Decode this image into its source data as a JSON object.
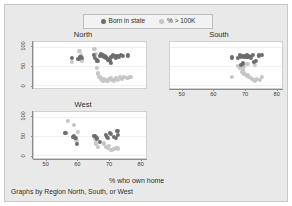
{
  "chart_data": {
    "type": "scatter",
    "title": "",
    "xlabel": "% who own home",
    "ylabel": "",
    "caption": "Graphs by Region North, South, or West",
    "xlim": [
      46,
      82
    ],
    "ylim": [
      -8,
      112
    ],
    "xticks": [
      50,
      60,
      70,
      80
    ],
    "yticks": [
      0,
      50,
      100
    ],
    "grid": true,
    "legend_position": "top-center",
    "colors": {
      "born_in_state": "#6d6d6d",
      "pct_over_100k": "#c6c6c6",
      "figure_background": "#e9e9e9",
      "plot_background": "#ffffff",
      "axis": "#8d8d8d",
      "text": "#2e2e2e"
    },
    "legend": [
      {
        "label": "Born in state",
        "color": "#6d6d6d"
      },
      {
        "label": "% > 100K",
        "color": "#c6c6c6"
      }
    ],
    "panels": [
      {
        "name": "North",
        "title": "North",
        "series": [
          {
            "name": "Born in state",
            "color": "#6d6d6d",
            "points": [
              [
                58.2,
                71
              ],
              [
                60.3,
                68
              ],
              [
                60.9,
                73
              ],
              [
                61.4,
                70
              ],
              [
                65.3,
                78
              ],
              [
                65.6,
                71
              ],
              [
                66.2,
                64
              ],
              [
                66.5,
                62
              ],
              [
                67.1,
                75
              ],
              [
                67.6,
                80
              ],
              [
                68.0,
                77
              ],
              [
                68.4,
                74
              ],
              [
                68.8,
                76
              ],
              [
                69.1,
                72
              ],
              [
                69.5,
                70
              ],
              [
                69.9,
                66
              ],
              [
                70.3,
                64
              ],
              [
                70.6,
                58
              ],
              [
                70.9,
                73
              ],
              [
                71.4,
                78
              ],
              [
                71.9,
                75
              ],
              [
                72.3,
                72
              ],
              [
                72.8,
                76
              ],
              [
                73.2,
                74
              ],
              [
                73.9,
                78
              ],
              [
                74.6,
                75
              ],
              [
                76.1,
                77
              ]
            ]
          },
          {
            "name": "% > 100K",
            "color": "#c6c6c6",
            "points": [
              [
                58.2,
                60
              ],
              [
                60.6,
                88
              ],
              [
                61.0,
                78
              ],
              [
                61.3,
                64
              ],
              [
                65.4,
                95
              ],
              [
                65.8,
                82
              ],
              [
                66.1,
                45
              ],
              [
                66.6,
                30
              ],
              [
                67.0,
                22
              ],
              [
                67.4,
                17
              ],
              [
                67.8,
                14
              ],
              [
                68.2,
                12
              ],
              [
                68.6,
                15
              ],
              [
                69.0,
                11
              ],
              [
                69.4,
                13
              ],
              [
                69.8,
                10
              ],
              [
                70.2,
                16
              ],
              [
                70.7,
                19
              ],
              [
                71.2,
                14
              ],
              [
                71.8,
                12
              ],
              [
                72.4,
                17
              ],
              [
                73.0,
                13
              ],
              [
                73.6,
                20
              ],
              [
                74.3,
                16
              ],
              [
                75.0,
                22
              ],
              [
                76.0,
                18
              ],
              [
                77.0,
                21
              ]
            ]
          }
        ]
      },
      {
        "name": "South",
        "title": "South",
        "series": [
          {
            "name": "Born in state",
            "color": "#6d6d6d",
            "points": [
              [
                65.8,
                72
              ],
              [
                67.8,
                71
              ],
              [
                68.5,
                79
              ],
              [
                68.9,
                74
              ],
              [
                69.3,
                76
              ],
              [
                69.7,
                73
              ],
              [
                70.0,
                75
              ],
              [
                70.3,
                74
              ],
              [
                70.6,
                77
              ],
              [
                70.9,
                73
              ],
              [
                71.2,
                76
              ],
              [
                71.6,
                74
              ],
              [
                72.0,
                72
              ],
              [
                72.6,
                78
              ],
              [
                73.1,
                60
              ],
              [
                73.6,
                62
              ],
              [
                74.5,
                77
              ],
              [
                75.6,
                78
              ],
              [
                69.5,
                56
              ],
              [
                68.8,
                52
              ]
            ]
          },
          {
            "name": "% > 100K",
            "color": "#c6c6c6",
            "points": [
              [
                66.0,
                22
              ],
              [
                67.9,
                50
              ],
              [
                68.6,
                44
              ],
              [
                69.0,
                35
              ],
              [
                69.4,
                38
              ],
              [
                69.8,
                30
              ],
              [
                70.2,
                28
              ],
              [
                70.6,
                24
              ],
              [
                71.0,
                26
              ],
              [
                71.4,
                20
              ],
              [
                71.9,
                18
              ],
              [
                72.4,
                16
              ],
              [
                72.9,
                14
              ],
              [
                73.4,
                12
              ],
              [
                74.0,
                15
              ],
              [
                74.8,
                13
              ],
              [
                75.5,
                20
              ],
              [
                70.9,
                55
              ],
              [
                69.6,
                47
              ],
              [
                73.2,
                52
              ]
            ]
          }
        ]
      },
      {
        "name": "West",
        "title": "West",
        "series": [
          {
            "name": "Born in state",
            "color": "#6d6d6d",
            "points": [
              [
                56.1,
                58
              ],
              [
                58.6,
                47
              ],
              [
                58.9,
                50
              ],
              [
                59.3,
                44
              ],
              [
                59.8,
                28
              ],
              [
                65.4,
                50
              ],
              [
                65.8,
                47
              ],
              [
                66.3,
                43
              ],
              [
                67.2,
                34
              ],
              [
                69.0,
                52
              ],
              [
                69.4,
                48
              ],
              [
                69.8,
                44
              ],
              [
                70.4,
                58
              ],
              [
                70.8,
                55
              ],
              [
                71.6,
                47
              ],
              [
                72.3,
                45
              ],
              [
                72.8,
                62
              ],
              [
                73.0,
                52
              ]
            ]
          },
          {
            "name": "% > 100K",
            "color": "#c6c6c6",
            "points": [
              [
                57.0,
                88
              ],
              [
                58.9,
                78
              ],
              [
                59.4,
                40
              ],
              [
                59.8,
                36
              ],
              [
                65.5,
                42
              ],
              [
                66.0,
                30
              ],
              [
                66.6,
                20
              ],
              [
                68.6,
                30
              ],
              [
                69.2,
                22
              ],
              [
                69.8,
                18
              ],
              [
                70.2,
                24
              ],
              [
                70.9,
                14
              ],
              [
                71.8,
                16
              ],
              [
                72.5,
                19
              ],
              [
                73.1,
                17
              ],
              [
                60.0,
                60
              ]
            ]
          }
        ]
      }
    ]
  }
}
